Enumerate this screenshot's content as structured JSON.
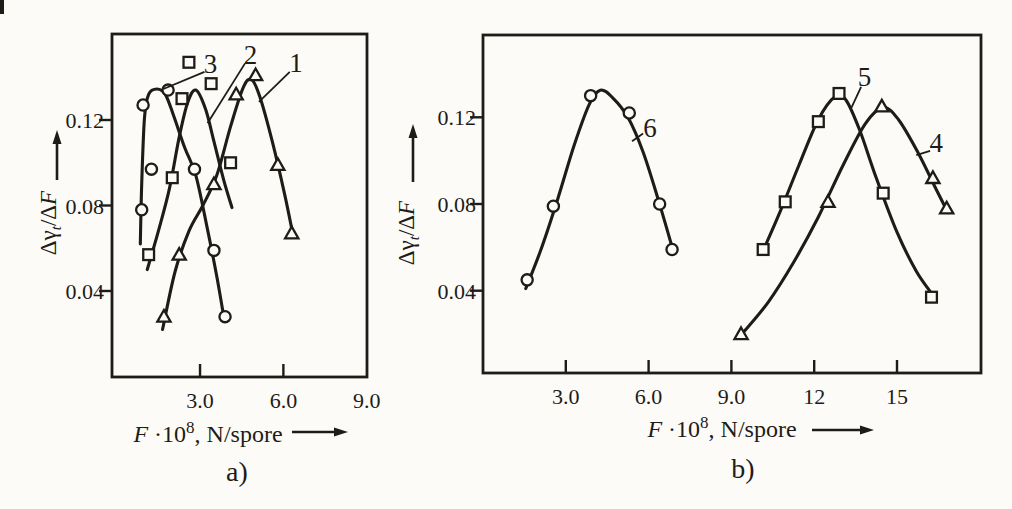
{
  "figure": {
    "background": "#fcfbf7",
    "ink_color": "#1f1c18"
  },
  "chart_data": [
    {
      "type": "scatter",
      "panel_label": "a)",
      "xlabel": {
        "f": "F",
        "times": " ·10",
        "sup": "8",
        "rest": ", N/spore"
      },
      "ylabel": {
        "pre": "Δγ",
        "sub": "t",
        "post": "/Δ",
        "f": "F"
      },
      "xlim": [
        0,
        9.2
      ],
      "ylim": [
        0,
        0.16
      ],
      "grid": false,
      "xticks": [
        {
          "value": 3,
          "label": "3.0"
        },
        {
          "value": 6,
          "label": "6.0"
        },
        {
          "value": 9,
          "label": "9.0"
        }
      ],
      "yticks": [
        {
          "value": 0.04,
          "label": "0.04"
        },
        {
          "value": 0.08,
          "label": "0.08"
        },
        {
          "value": 0.12,
          "label": "0.12"
        }
      ],
      "series": [
        {
          "name": "1",
          "marker": "triangle",
          "points": [
            [
              1.7,
              0.028
            ],
            [
              2.25,
              0.057
            ],
            [
              3.5,
              0.09
            ],
            [
              4.3,
              0.132
            ],
            [
              5.0,
              0.141
            ],
            [
              5.8,
              0.099
            ],
            [
              6.3,
              0.067
            ]
          ],
          "curve": [
            [
              1.65,
              0.022
            ],
            [
              2.1,
              0.049
            ],
            [
              2.6,
              0.068
            ],
            [
              3.1,
              0.08
            ],
            [
              3.6,
              0.094
            ],
            [
              4.1,
              0.117
            ],
            [
              4.55,
              0.135
            ],
            [
              4.85,
              0.139
            ],
            [
              5.15,
              0.131
            ],
            [
              5.6,
              0.11
            ],
            [
              6.05,
              0.085
            ],
            [
              6.35,
              0.066
            ]
          ],
          "label_xy": [
            6.45,
            0.1465
          ],
          "leader": [
            [
              6.23,
              0.1425
            ],
            [
              5.12,
              0.1285
            ]
          ]
        },
        {
          "name": "2",
          "marker": "square",
          "points": [
            [
              1.15,
              0.057
            ],
            [
              2.0,
              0.093
            ],
            [
              2.35,
              0.13
            ],
            [
              2.6,
              0.147
            ],
            [
              3.4,
              0.137
            ],
            [
              4.1,
              0.1
            ]
          ],
          "curve": [
            [
              1.1,
              0.05
            ],
            [
              1.5,
              0.068
            ],
            [
              1.9,
              0.088
            ],
            [
              2.25,
              0.112
            ],
            [
              2.55,
              0.128
            ],
            [
              2.85,
              0.134
            ],
            [
              3.2,
              0.125
            ],
            [
              3.5,
              0.11
            ],
            [
              3.85,
              0.092
            ],
            [
              4.15,
              0.079
            ]
          ],
          "label_xy": [
            4.82,
            0.1505
          ],
          "leader": [
            [
              4.62,
              0.1465
            ],
            [
              3.27,
              0.1185
            ]
          ]
        },
        {
          "name": "3",
          "marker": "circle",
          "points": [
            [
              0.9,
              0.078
            ],
            [
              0.95,
              0.127
            ],
            [
              1.25,
              0.097
            ],
            [
              1.85,
              0.134
            ],
            [
              2.8,
              0.097
            ],
            [
              3.5,
              0.059
            ],
            [
              3.9,
              0.028
            ]
          ],
          "curve": [
            [
              0.85,
              0.062
            ],
            [
              0.9,
              0.09
            ],
            [
              1.0,
              0.121
            ],
            [
              1.15,
              0.132
            ],
            [
              1.45,
              0.1345
            ],
            [
              1.75,
              0.132
            ],
            [
              2.05,
              0.122
            ],
            [
              2.45,
              0.107
            ],
            [
              2.85,
              0.094
            ],
            [
              3.25,
              0.07
            ],
            [
              3.6,
              0.047
            ],
            [
              3.88,
              0.026
            ]
          ],
          "label_xy": [
            3.38,
            0.146
          ],
          "leader": [
            [
              3.16,
              0.1425
            ],
            [
              1.68,
              0.1345
            ]
          ]
        }
      ]
    },
    {
      "type": "scatter",
      "panel_label": "b)",
      "xlabel": {
        "f": "F",
        "times": " ·10",
        "sup": "8",
        "rest": ", N/spore"
      },
      "ylabel": {
        "pre": "Δγ",
        "sub": "t",
        "post": "/Δ",
        "f": "F"
      },
      "xlim": [
        0,
        18
      ],
      "ylim": [
        0,
        0.158
      ],
      "grid": false,
      "xticks": [
        {
          "value": 3,
          "label": "3.0"
        },
        {
          "value": 6,
          "label": "6.0"
        },
        {
          "value": 9,
          "label": "9.0"
        },
        {
          "value": 12,
          "label": "12"
        },
        {
          "value": 15,
          "label": "15"
        }
      ],
      "yticks": [
        {
          "value": 0.04,
          "label": "0.04"
        },
        {
          "value": 0.08,
          "label": "0.08"
        },
        {
          "value": 0.12,
          "label": "0.12"
        }
      ],
      "series": [
        {
          "name": "4",
          "marker": "triangle",
          "points": [
            [
              9.35,
              0.02
            ],
            [
              12.5,
              0.081
            ],
            [
              14.45,
              0.125
            ],
            [
              16.3,
              0.092
            ],
            [
              16.8,
              0.078
            ]
          ],
          "curve": [
            [
              9.45,
              0.021
            ],
            [
              10.35,
              0.035
            ],
            [
              11.25,
              0.053
            ],
            [
              12.15,
              0.074
            ],
            [
              13.05,
              0.098
            ],
            [
              13.85,
              0.117
            ],
            [
              14.5,
              0.1245
            ],
            [
              15.05,
              0.119
            ],
            [
              15.75,
              0.104
            ],
            [
              16.45,
              0.086
            ],
            [
              16.85,
              0.076
            ]
          ],
          "label_xy": [
            16.42,
            0.108
          ],
          "leader": [
            [
              16.2,
              0.1045
            ],
            [
              15.7,
              0.1025
            ]
          ]
        },
        {
          "name": "5",
          "marker": "square",
          "points": [
            [
              10.15,
              0.059
            ],
            [
              10.95,
              0.081
            ],
            [
              12.15,
              0.118
            ],
            [
              12.9,
              0.131
            ],
            [
              14.5,
              0.085
            ],
            [
              16.25,
              0.037
            ]
          ],
          "curve": [
            [
              10.1,
              0.057
            ],
            [
              10.75,
              0.076
            ],
            [
              11.45,
              0.098
            ],
            [
              12.15,
              0.119
            ],
            [
              12.75,
              0.1295
            ],
            [
              13.15,
              0.128
            ],
            [
              13.65,
              0.114
            ],
            [
              14.25,
              0.092
            ],
            [
              15.0,
              0.067
            ],
            [
              15.7,
              0.049
            ],
            [
              16.3,
              0.038
            ]
          ],
          "label_xy": [
            13.82,
            0.1385
          ],
          "leader": [
            [
              13.7,
              0.134
            ],
            [
              13.35,
              0.1245
            ]
          ]
        },
        {
          "name": "6",
          "marker": "circle",
          "points": [
            [
              1.6,
              0.045
            ],
            [
              2.55,
              0.079
            ],
            [
              3.9,
              0.13
            ],
            [
              5.3,
              0.122
            ],
            [
              6.4,
              0.08
            ],
            [
              6.85,
              0.059
            ]
          ],
          "curve": [
            [
              1.55,
              0.041
            ],
            [
              2.1,
              0.059
            ],
            [
              2.7,
              0.082
            ],
            [
              3.3,
              0.107
            ],
            [
              3.85,
              0.126
            ],
            [
              4.25,
              0.1325
            ],
            [
              4.7,
              0.129
            ],
            [
              5.25,
              0.12
            ],
            [
              5.8,
              0.104
            ],
            [
              6.35,
              0.082
            ],
            [
              6.9,
              0.058
            ]
          ],
          "label_xy": [
            6.05,
            0.115
          ],
          "leader": [
            [
              5.8,
              0.1125
            ],
            [
              5.4,
              0.109
            ]
          ]
        }
      ]
    }
  ]
}
